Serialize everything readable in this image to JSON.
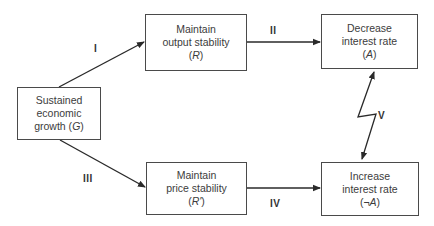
{
  "diagram": {
    "type": "flow",
    "nodes": {
      "g": {
        "line1": "Sustained",
        "line2": "economic",
        "line3_prefix": "growth (",
        "symbol": "G",
        "line3_suffix": ")"
      },
      "r": {
        "line1": "Maintain",
        "line2": "output stability",
        "sym_prefix": "(",
        "symbol": "R",
        "sym_suffix": ")"
      },
      "r_prime": {
        "line1": "Maintain",
        "line2": "price stability",
        "sym_prefix": "(",
        "symbol": "R'",
        "sym_suffix": ")"
      },
      "a": {
        "line1": "Decrease",
        "line2": "interest rate",
        "sym_prefix": "(",
        "symbol": "A",
        "sym_suffix": ")"
      },
      "not_a": {
        "line1": "Increase",
        "line2": "interest rate",
        "sym_prefix": "(¬",
        "symbol": "A",
        "sym_suffix": ")"
      }
    },
    "edges": {
      "e1": {
        "label": "I",
        "from": "g",
        "to": "r"
      },
      "e2": {
        "label": "II",
        "from": "r",
        "to": "a"
      },
      "e3": {
        "label": "III",
        "from": "g",
        "to": "r_prime"
      },
      "e4": {
        "label": "IV",
        "from": "r_prime",
        "to": "not_a"
      },
      "e5": {
        "label": "V",
        "from": "a",
        "to": "not_a",
        "style": "conflict-bidirectional"
      }
    },
    "colors": {
      "stroke": "#2a2a2a",
      "box_border": "#4a4a4a",
      "text": "#3c3c3c",
      "background": "#ffffff"
    }
  }
}
